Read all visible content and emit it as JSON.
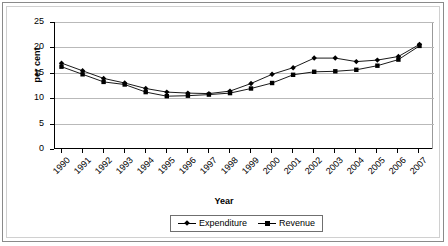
{
  "chart_data": {
    "type": "line",
    "title": "",
    "xlabel": "Year",
    "ylabel": "per cent",
    "ylim": [
      0,
      25
    ],
    "yticks": [
      0,
      5,
      10,
      15,
      20,
      25
    ],
    "grid": true,
    "legend_position": "bottom",
    "categories": [
      "1990",
      "1991",
      "1992",
      "1993",
      "1994",
      "1995",
      "1996",
      "1997",
      "1998",
      "1999",
      "2000",
      "2001",
      "2002",
      "2003",
      "2004",
      "2005",
      "2006",
      "2007"
    ],
    "series": [
      {
        "name": "Expenditure",
        "marker": "diamond",
        "values": [
          16.9,
          15.4,
          13.9,
          13.0,
          11.9,
          11.2,
          11.0,
          10.9,
          11.4,
          12.9,
          14.7,
          16.0,
          17.9,
          17.9,
          17.2,
          17.5,
          18.2,
          20.6
        ]
      },
      {
        "name": "Revenue",
        "marker": "square",
        "values": [
          16.2,
          14.7,
          13.2,
          12.7,
          11.2,
          10.4,
          10.5,
          10.7,
          11.0,
          11.9,
          13.0,
          14.6,
          15.2,
          15.3,
          15.6,
          16.4,
          17.6,
          20.3
        ]
      }
    ]
  },
  "legend": {
    "items": [
      {
        "label": "Expenditure"
      },
      {
        "label": "Revenue"
      }
    ]
  },
  "axes": {
    "x_title": "Year",
    "y_title": "per cent"
  }
}
